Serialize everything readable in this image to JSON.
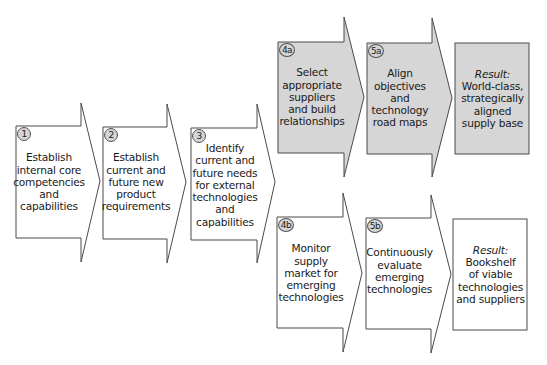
{
  "colors": {
    "shaded_fill": "#d6d6d6",
    "plain_fill": "#ffffff",
    "stroke": "#4a4a4a"
  },
  "steps": [
    {
      "id": "1",
      "badge": "1",
      "lines": [
        "Establish",
        "internal core",
        "competencies",
        "and",
        "capabilities"
      ],
      "shaded": false
    },
    {
      "id": "2",
      "badge": "2",
      "lines": [
        "Establish",
        "current and",
        "future new",
        "product",
        "requirements"
      ],
      "shaded": false
    },
    {
      "id": "3",
      "badge": "3",
      "lines": [
        "Identify",
        "current and",
        "future needs",
        "for external",
        "technologies",
        "and",
        "capabilities"
      ],
      "shaded": false
    },
    {
      "id": "4a",
      "badge": "4a",
      "lines": [
        "Select",
        "appropriate",
        "suppliers",
        "and build",
        "relationships"
      ],
      "shaded": true
    },
    {
      "id": "5a",
      "badge": "5a",
      "lines": [
        "Align",
        "objectives",
        "and",
        "technology",
        "road maps"
      ],
      "shaded": true
    },
    {
      "id": "4b",
      "badge": "4b",
      "lines": [
        "Monitor",
        "supply",
        "market for",
        "emerging",
        "technologies"
      ],
      "shaded": false
    },
    {
      "id": "5b",
      "badge": "5b",
      "lines": [
        "Continuously",
        "evaluate",
        "emerging",
        "technologies"
      ],
      "shaded": false
    }
  ],
  "results": [
    {
      "id": "result-a",
      "heading": "Result:",
      "lines": [
        "World-class,",
        "strategically",
        "aligned",
        "supply base"
      ],
      "shaded": true
    },
    {
      "id": "result-b",
      "heading": "Result:",
      "lines": [
        "Bookshelf",
        "of viable",
        "technologies",
        "and suppliers"
      ],
      "shaded": false
    }
  ]
}
